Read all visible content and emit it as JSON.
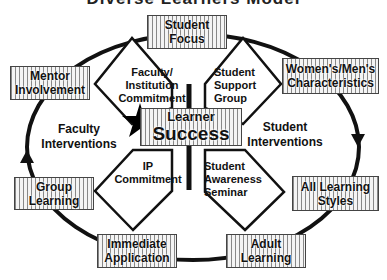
{
  "title": "Diverse Learners Model",
  "outer_boxes": {
    "student_focus": [
      "Student",
      "Focus"
    ],
    "mentor_involvement": [
      "Mentor",
      "Involvement"
    ],
    "womens_mens": [
      "Women's/Men's",
      "Characteristics"
    ],
    "group_learning": [
      "Group",
      "Learning"
    ],
    "all_learning_styles": [
      "All Learning",
      "Styles"
    ],
    "immediate_application": [
      "Immediate",
      "Application"
    ],
    "adult_learning": [
      "Adult",
      "Learning"
    ]
  },
  "diamonds": {
    "top_left": [
      "Faculty/",
      "Institution",
      "Commitment"
    ],
    "top_right": [
      "Student",
      "Support",
      "Group"
    ],
    "bottom_left": [
      "IP",
      "Commitment"
    ],
    "bottom_right": [
      "Student",
      "Awareness",
      "Seminar"
    ]
  },
  "center": {
    "line1": "Learner",
    "line2": "Success"
  },
  "side_labels": {
    "faculty_interventions": [
      "Faculty",
      "Interventions"
    ],
    "student_interventions": [
      "Student",
      "Interventions"
    ]
  },
  "colors": {
    "stroke": "#111111",
    "box_fill": "#f4f4f4",
    "hatch": "#888888"
  }
}
